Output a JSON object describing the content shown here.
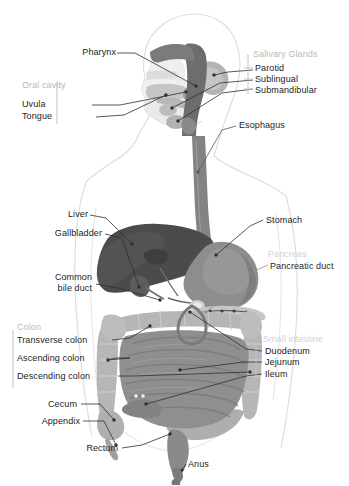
{
  "figure": {
    "background_color": "#ffffff",
    "label_color": "#1c1c1c",
    "group_label_color": "#b9b9b9",
    "faint_label_color": "#d2d2d2",
    "leader_line_color": "#2b2b2b",
    "body_outline_color": "#d8d8d8",
    "organ_colors": {
      "liver": "#4b4b4b",
      "stomach": "#8d8d8d",
      "esophagus": "#7f7f7f",
      "pharynx": "#6f6f6f",
      "colon": "#b6b6b6",
      "small_intestine": "#8f8f8f",
      "rectum": "#8a8a8a",
      "gallbladder": "#5a5a5a",
      "pancreas": "#c8c8c8",
      "salivary_gland": "#b0b0b0",
      "tongue": "#c2c2c2",
      "skull": "#e9e9e9"
    }
  },
  "labels": {
    "left": [
      {
        "key": "pharynx",
        "text": "Pharynx"
      },
      {
        "key": "oral_cavity",
        "text": "Oral cavity",
        "group": true
      },
      {
        "key": "uvula",
        "text": "Uvula"
      },
      {
        "key": "tongue",
        "text": "Tongue"
      },
      {
        "key": "liver",
        "text": "Liver"
      },
      {
        "key": "gallbladder",
        "text": "Gallbladder"
      },
      {
        "key": "common_bile_duct_1",
        "text": "Common"
      },
      {
        "key": "common_bile_duct_2",
        "text": "bile duct"
      },
      {
        "key": "colon",
        "text": "Colon",
        "group": true
      },
      {
        "key": "transverse_colon",
        "text": "Transverse colon"
      },
      {
        "key": "ascending_colon",
        "text": "Ascending colon"
      },
      {
        "key": "descending_colon",
        "text": "Descending colon"
      },
      {
        "key": "cecum",
        "text": "Cecum"
      },
      {
        "key": "appendix",
        "text": "Appendix"
      },
      {
        "key": "rectum",
        "text": "Rectum"
      }
    ],
    "right": [
      {
        "key": "salivary_glands",
        "text": "Salivary Glands",
        "group": true
      },
      {
        "key": "parotid",
        "text": "Parotid"
      },
      {
        "key": "sublingual",
        "text": "Sublingual"
      },
      {
        "key": "submandibular",
        "text": "Submandibular"
      },
      {
        "key": "esophagus",
        "text": "Esophagus"
      },
      {
        "key": "stomach",
        "text": "Stomach"
      },
      {
        "key": "pancreas",
        "text": "Pancreas",
        "faint": true
      },
      {
        "key": "pancreatic_duct",
        "text": "Pancreatic duct"
      },
      {
        "key": "small_intestine",
        "text": "Small intestine",
        "faint": true
      },
      {
        "key": "duodenum",
        "text": "Duodenum"
      },
      {
        "key": "jejunum",
        "text": "Jejunum"
      },
      {
        "key": "ileum",
        "text": "Ileum"
      }
    ],
    "bottom": [
      {
        "key": "anus",
        "text": "Anus"
      }
    ]
  }
}
